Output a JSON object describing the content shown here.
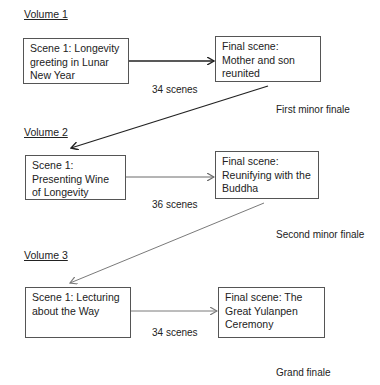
{
  "volumes": [
    {
      "label": "Volume 1",
      "first_scene": "Scene 1: Longevity greeting in Lunar New Year",
      "final_scene": "Final scene: Mother and son reunited",
      "scene_count": "34 scenes",
      "finale": "First minor finale",
      "line_color": "#222222"
    },
    {
      "label": "Volume 2",
      "first_scene": "Scene 1: Presenting Wine of Longevity",
      "final_scene": "Final scene: Reunifying with the Buddha",
      "scene_count": "36 scenes",
      "finale": "Second minor finale",
      "line_color": "#6a6a6a"
    },
    {
      "label": "Volume 3",
      "first_scene": "Scene 1: Lecturing about the Way",
      "final_scene": "Final scene: The Great Yulanpen Ceremony",
      "scene_count": "34 scenes",
      "finale": "Grand finale",
      "line_color": "#7a7a7a"
    }
  ],
  "transitions": [
    {
      "from": "Volume 1 final scene",
      "to": "Volume 2 first scene",
      "line_color": "#222222"
    },
    {
      "from": "Volume 2 final scene",
      "to": "Volume 3 first scene",
      "line_color": "#7a7a7a"
    }
  ]
}
